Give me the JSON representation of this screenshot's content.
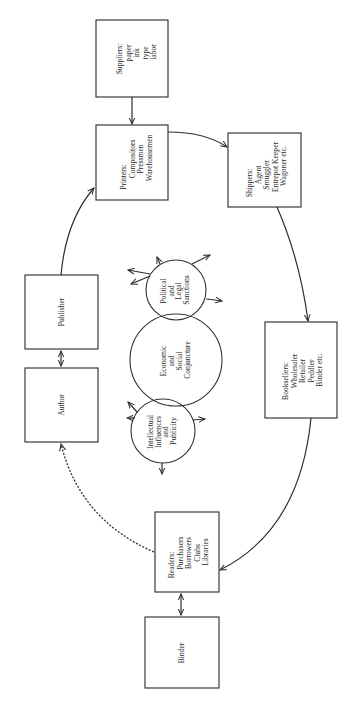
{
  "figure": {
    "orientation": "rotated-90-ccw",
    "colors": {
      "ink": "#2e2e2e",
      "background": "#ffffff"
    }
  },
  "nodes": {
    "suppliers": {
      "title": "Suppliers:",
      "lines": [
        "paper",
        "ink",
        "type",
        "labor"
      ]
    },
    "printers": {
      "title": "Printers:",
      "lines": [
        "Compositors",
        "Pressmen",
        "Warehousemen"
      ]
    },
    "shippers": {
      "title": "Shippers:",
      "lines": [
        "Agent",
        "Smuggler",
        "Entrepot Keeper",
        "Wagoner etc."
      ]
    },
    "booksellers": {
      "title": "Booksellers:",
      "lines": [
        "Wholesaler",
        "Retailer",
        "Peddler",
        "Binder etc."
      ]
    },
    "readers": {
      "title": "Readers:",
      "lines": [
        "Purchasers",
        "Borrowers",
        "Clubs",
        "Libraries"
      ]
    },
    "binder": {
      "title": "Binder"
    },
    "author": {
      "title": "Author"
    },
    "publisher": {
      "title": "Publisher"
    }
  },
  "influences": {
    "political": {
      "lines": [
        "Political",
        "and",
        "Legal",
        "Sanctions"
      ]
    },
    "economic": {
      "lines": [
        "Economic",
        "and",
        "Social",
        "Conjuncture"
      ]
    },
    "intellectual": {
      "lines": [
        "Intellectual",
        "Influences",
        "and",
        "Publicity"
      ]
    }
  },
  "edges": [
    {
      "from": "suppliers",
      "to": "printers",
      "style": "solid"
    },
    {
      "from": "printers",
      "to": "shippers",
      "style": "solid"
    },
    {
      "from": "shippers",
      "to": "booksellers",
      "style": "solid"
    },
    {
      "from": "booksellers",
      "to": "readers",
      "style": "solid"
    },
    {
      "from": "readers",
      "to": "binder",
      "style": "solid-bidirectional"
    },
    {
      "from": "readers",
      "to": "author",
      "style": "dotted"
    },
    {
      "from": "author",
      "to": "publisher",
      "style": "solid-bidirectional"
    },
    {
      "from": "publisher",
      "to": "printers",
      "style": "solid"
    }
  ]
}
